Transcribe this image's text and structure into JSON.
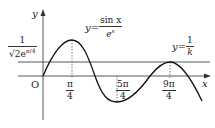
{
  "axes": {
    "x_label": "x",
    "y_label": "y",
    "origin_label": "O"
  },
  "curves": {
    "main": {
      "lhs": "y=",
      "numerator": "sin x",
      "denominator": "e",
      "denominator_exp": "x"
    },
    "line": {
      "lhs": "y=",
      "numerator": "1",
      "denominator": "k"
    }
  },
  "y_tick": {
    "numerator": "1",
    "denominator": "√2e",
    "denominator_exp": "π/4"
  },
  "x_ticks": [
    {
      "numerator": "π",
      "denominator": "4"
    },
    {
      "numerator": "5π",
      "denominator": "4"
    },
    {
      "numerator": "9π",
      "denominator": "4"
    }
  ],
  "colors": {
    "stroke": "#222222",
    "background": "#ffffff"
  }
}
